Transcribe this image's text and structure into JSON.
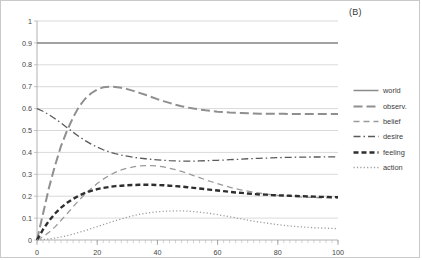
{
  "panel": {
    "label": "(B)"
  },
  "legend": {
    "position": "right",
    "entries": [
      {
        "name": "world",
        "label": "world",
        "dash": "none",
        "width": 1.5,
        "color": "#8a8a8a"
      },
      {
        "name": "observ",
        "label": "observ.",
        "dash": "9,4",
        "width": 2.0,
        "color": "#8f8f8f"
      },
      {
        "name": "belief",
        "label": "belief",
        "dash": "6,4",
        "width": 1.3,
        "color": "#9a9a9a"
      },
      {
        "name": "desire",
        "label": "desire",
        "dash": "7,3,1.5,3",
        "width": 1.3,
        "color": "#5a5a5a"
      },
      {
        "name": "feeling",
        "label": "feeling",
        "dash": "5,3",
        "width": 2.4,
        "color": "#2e2e2e"
      },
      {
        "name": "action",
        "label": "action",
        "dash": "1.2,2.2",
        "width": 1.3,
        "color": "#9d9d9d"
      }
    ]
  },
  "axes": {
    "y_ticks": [
      "1",
      "0.9",
      "0.8",
      "0.7",
      "0.6",
      "0.5",
      "0.4",
      "0.3",
      "0.2",
      "0.1",
      "0"
    ],
    "x_ticks": [
      "0",
      "20",
      "40",
      "60",
      "80",
      "100"
    ],
    "grid": "horizontal",
    "grid_color": "#bfbfbf",
    "axis_color": "#9e9e9e"
  },
  "chart_data": {
    "type": "line",
    "title": "",
    "xlabel": "",
    "ylabel": "",
    "xlim": [
      0,
      100
    ],
    "ylim": [
      0,
      1
    ],
    "grid": true,
    "legend_position": "right",
    "x": [
      0,
      2,
      4,
      6,
      8,
      10,
      12,
      14,
      16,
      18,
      20,
      22,
      24,
      26,
      28,
      30,
      32,
      34,
      36,
      38,
      40,
      42,
      44,
      46,
      48,
      50,
      52,
      54,
      56,
      58,
      60,
      62,
      64,
      66,
      68,
      70,
      72,
      74,
      76,
      78,
      80,
      82,
      84,
      86,
      88,
      90,
      92,
      94,
      96,
      98,
      100
    ],
    "series": [
      {
        "name": "world",
        "style": "solid",
        "values": [
          0.9,
          0.9,
          0.9,
          0.9,
          0.9,
          0.9,
          0.9,
          0.9,
          0.9,
          0.9,
          0.9,
          0.9,
          0.9,
          0.9,
          0.9,
          0.9,
          0.9,
          0.9,
          0.9,
          0.9,
          0.9,
          0.9,
          0.9,
          0.9,
          0.9,
          0.9,
          0.9,
          0.9,
          0.9,
          0.9,
          0.9,
          0.9,
          0.9,
          0.9,
          0.9,
          0.9,
          0.9,
          0.9,
          0.9,
          0.9,
          0.9,
          0.9,
          0.9,
          0.9,
          0.9,
          0.9,
          0.9,
          0.9,
          0.9,
          0.9,
          0.9
        ]
      },
      {
        "name": "observ.",
        "style": "long-dash",
        "values": [
          0.0,
          0.12,
          0.24,
          0.34,
          0.43,
          0.5,
          0.56,
          0.61,
          0.645,
          0.67,
          0.687,
          0.697,
          0.7,
          0.699,
          0.695,
          0.689,
          0.681,
          0.672,
          0.663,
          0.653,
          0.643,
          0.634,
          0.626,
          0.618,
          0.611,
          0.605,
          0.6,
          0.596,
          0.592,
          0.589,
          0.586,
          0.584,
          0.582,
          0.581,
          0.58,
          0.579,
          0.578,
          0.577,
          0.577,
          0.576,
          0.576,
          0.576,
          0.575,
          0.575,
          0.575,
          0.575,
          0.575,
          0.575,
          0.575,
          0.575,
          0.575
        ]
      },
      {
        "name": "belief",
        "style": "dash",
        "values": [
          0.0,
          0.015,
          0.035,
          0.06,
          0.09,
          0.12,
          0.152,
          0.182,
          0.21,
          0.235,
          0.258,
          0.278,
          0.295,
          0.309,
          0.32,
          0.328,
          0.334,
          0.338,
          0.34,
          0.34,
          0.338,
          0.334,
          0.328,
          0.321,
          0.313,
          0.304,
          0.294,
          0.285,
          0.275,
          0.266,
          0.257,
          0.249,
          0.241,
          0.234,
          0.228,
          0.223,
          0.218,
          0.214,
          0.21,
          0.207,
          0.204,
          0.202,
          0.2,
          0.198,
          0.196,
          0.195,
          0.194,
          0.193,
          0.192,
          0.191,
          0.19
        ]
      },
      {
        "name": "desire",
        "style": "dash-dot",
        "values": [
          0.6,
          0.588,
          0.572,
          0.554,
          0.534,
          0.513,
          0.492,
          0.472,
          0.454,
          0.438,
          0.424,
          0.412,
          0.402,
          0.394,
          0.388,
          0.383,
          0.378,
          0.374,
          0.371,
          0.368,
          0.366,
          0.364,
          0.362,
          0.361,
          0.36,
          0.36,
          0.36,
          0.361,
          0.362,
          0.363,
          0.364,
          0.365,
          0.367,
          0.368,
          0.369,
          0.371,
          0.372,
          0.373,
          0.374,
          0.375,
          0.376,
          0.377,
          0.377,
          0.378,
          0.378,
          0.379,
          0.379,
          0.379,
          0.38,
          0.38,
          0.38
        ]
      },
      {
        "name": "feeling",
        "style": "bold-dash",
        "values": [
          0.0,
          0.048,
          0.088,
          0.121,
          0.148,
          0.17,
          0.188,
          0.203,
          0.215,
          0.224,
          0.232,
          0.238,
          0.242,
          0.246,
          0.248,
          0.25,
          0.251,
          0.252,
          0.252,
          0.252,
          0.251,
          0.25,
          0.248,
          0.246,
          0.244,
          0.241,
          0.238,
          0.235,
          0.232,
          0.229,
          0.226,
          0.223,
          0.22,
          0.217,
          0.215,
          0.212,
          0.21,
          0.208,
          0.207,
          0.205,
          0.204,
          0.203,
          0.202,
          0.201,
          0.2,
          0.199,
          0.198,
          0.197,
          0.197,
          0.196,
          0.196
        ]
      },
      {
        "name": "action",
        "style": "dotted",
        "values": [
          0.0,
          0.002,
          0.005,
          0.009,
          0.014,
          0.02,
          0.027,
          0.035,
          0.043,
          0.052,
          0.061,
          0.07,
          0.079,
          0.088,
          0.096,
          0.104,
          0.111,
          0.117,
          0.122,
          0.126,
          0.129,
          0.131,
          0.132,
          0.133,
          0.133,
          0.132,
          0.13,
          0.127,
          0.124,
          0.12,
          0.116,
          0.111,
          0.106,
          0.101,
          0.096,
          0.091,
          0.086,
          0.082,
          0.078,
          0.074,
          0.07,
          0.067,
          0.064,
          0.062,
          0.06,
          0.058,
          0.056,
          0.055,
          0.054,
          0.053,
          0.052
        ]
      }
    ]
  }
}
